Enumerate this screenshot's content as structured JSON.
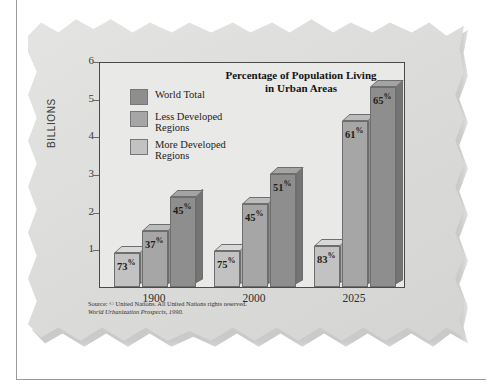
{
  "chart_data": {
    "type": "bar",
    "title": "Percentage of Population Living in Urban Areas",
    "title_line1": "Percentage of Population Living",
    "title_line2": "in Urban Areas",
    "xlabel": "",
    "ylabel": "BILLIONS",
    "categories": [
      "1900",
      "2000",
      "2025"
    ],
    "ylim": [
      0,
      6
    ],
    "yticks": [
      1,
      2,
      3,
      4,
      5,
      6
    ],
    "grid": false,
    "legend_position": "inside-top-left",
    "series": [
      {
        "name": "World Total",
        "color": "#8e8e8e",
        "values": [
          2.4,
          3.0,
          5.3
        ],
        "labels": [
          "45%",
          "51%",
          "65%"
        ]
      },
      {
        "name": "Less Developed Regions",
        "color": "#a6a6a6",
        "values": [
          1.5,
          2.2,
          4.4
        ],
        "labels": [
          "37%",
          "45%",
          "61%"
        ]
      },
      {
        "name": "More Developed Regions",
        "color": "#c2c2c2",
        "values": [
          0.9,
          0.95,
          1.1
        ],
        "labels": [
          "73%",
          "75%",
          "83%"
        ]
      }
    ],
    "bar_order_left_to_right": [
      "More Developed Regions",
      "Less Developed Regions",
      "World Total"
    ],
    "source_line1": "Source: © United Nations. All United Nations rights reserved.",
    "source_line2": "World Urbanization Prospects, 1990."
  },
  "legend": {
    "items": [
      {
        "label": "World Total",
        "label_line2": "",
        "color": "#8e8e8e"
      },
      {
        "label": "Less Developed",
        "label_line2": "Regions",
        "color": "#a6a6a6"
      },
      {
        "label": "More Developed",
        "label_line2": "Regions",
        "color": "#c2c2c2"
      }
    ]
  },
  "colors": {
    "paper": "#dedede",
    "plot_background": "#e9e9e7",
    "frame": "#4a4a4a",
    "world_total": "#8e8e8e",
    "less_developed": "#a6a6a6",
    "more_developed": "#c2c2c2"
  }
}
